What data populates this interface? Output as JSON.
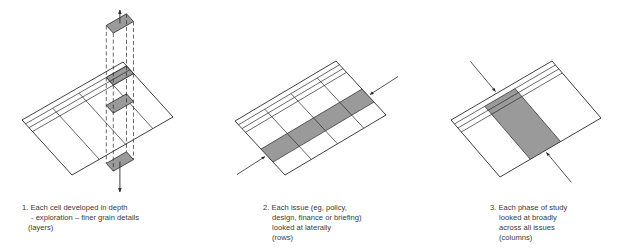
{
  "diagrams": [
    {
      "id": "layers",
      "caption": {
        "number": "1.",
        "lines": [
          "Each cell developed in depth",
          "- exploration – finer grain details",
          "(layers)"
        ]
      },
      "highlight": "cell",
      "arrows": "vertical-both"
    },
    {
      "id": "rows",
      "caption": {
        "number": "2.",
        "lines": [
          "Each issue (eg, policy,",
          "design, finance or briefing)",
          "looked at laterally",
          "(rows)"
        ]
      },
      "highlight": "row",
      "arrows": "lateral"
    },
    {
      "id": "columns",
      "caption": {
        "number": "3.",
        "lines": [
          "Each phase of study",
          "looked at broadly",
          "across all issues",
          "(columns)"
        ]
      },
      "highlight": "column",
      "arrows": "diagonal"
    }
  ],
  "colors": {
    "line": "#2a2a2a",
    "shade": "#9a9a9a",
    "text": "#3a3a3a"
  }
}
